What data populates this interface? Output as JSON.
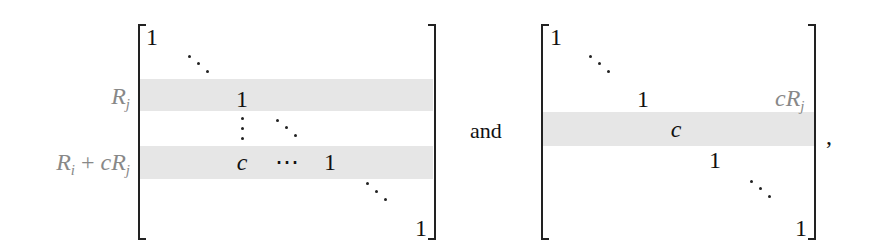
{
  "left_matrix": {
    "row_labels": {
      "rj": {
        "base": "R",
        "sub": "j"
      },
      "ri_plus_crj": {
        "p1": "R",
        "s1": "i",
        "op": " + ",
        "p2": "cR",
        "s2": "j"
      }
    },
    "entries": {
      "top_left": "1",
      "rj_pivot": "1",
      "ri_c": "c",
      "ri_hdots": "⋯",
      "ri_pivot": "1",
      "bottom_right": "1"
    },
    "band_color": "#e6e6e6"
  },
  "connector": "and",
  "right_matrix": {
    "entries": {
      "top_left": "1",
      "row_one": "1",
      "col_label": {
        "base": "cR",
        "sub": "j"
      },
      "band_c": "c",
      "row_after": "1",
      "bottom_right": "1"
    },
    "band_color": "#e6e6e6"
  },
  "trailing": ","
}
